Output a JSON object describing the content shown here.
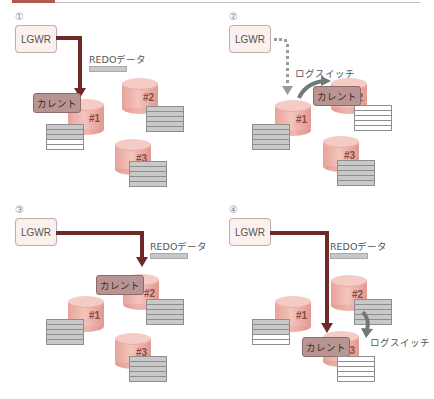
{
  "header": {
    "accent_color": "#b5584c",
    "line_color": "#bdbdbd"
  },
  "labels": {
    "lgwr": "LGWR",
    "redo_data": "REDOデータ",
    "current": "カレント",
    "log_switch": "ログスイッチ"
  },
  "colors": {
    "write_arrow": "#6e2a26",
    "dotted_arrow": "#9a9a9a",
    "switch_arrow": "#6f7a77",
    "cylinder": "#eeb3ab",
    "current_label_bg": "#b89592",
    "used_row": "#c9c9c9",
    "empty_row": "#ffffff"
  },
  "panels": [
    {
      "step": "①",
      "description": "LGWR writes REDO data to current log group #1",
      "lgwr_arrow": "solid",
      "current_group": "#1",
      "log_switch": false,
      "groups": [
        {
          "name": "#1",
          "rows": [
            "used",
            "used",
            "used",
            "empty",
            "empty"
          ]
        },
        {
          "name": "#2",
          "rows": [
            "used",
            "used",
            "used",
            "used",
            "used"
          ]
        },
        {
          "name": "#3",
          "rows": [
            "used",
            "used",
            "used",
            "used",
            "used"
          ]
        }
      ]
    },
    {
      "step": "②",
      "description": "Group #1 full; log switch moves current to #2",
      "lgwr_arrow": "dotted",
      "current_group": "#2",
      "log_switch": true,
      "groups": [
        {
          "name": "#1",
          "rows": [
            "used",
            "used",
            "used",
            "used",
            "used"
          ]
        },
        {
          "name": "#2",
          "rows": [
            "empty",
            "empty",
            "empty",
            "empty",
            "empty"
          ]
        },
        {
          "name": "#3",
          "rows": [
            "used",
            "used",
            "used",
            "used",
            "used"
          ]
        }
      ]
    },
    {
      "step": "③",
      "description": "LGWR writes REDO data to current log group #2",
      "lgwr_arrow": "solid",
      "current_group": "#2",
      "log_switch": false,
      "groups": [
        {
          "name": "#1",
          "rows": [
            "used",
            "used",
            "used",
            "used",
            "used"
          ]
        },
        {
          "name": "#2",
          "rows": [
            "used",
            "used",
            "used",
            "used",
            "used"
          ]
        },
        {
          "name": "#3",
          "rows": [
            "used",
            "used",
            "used",
            "used",
            "used"
          ]
        }
      ]
    },
    {
      "step": "④",
      "description": "Log switch to group #3; LGWR writes to #3",
      "lgwr_arrow": "solid",
      "current_group": "#3",
      "log_switch": true,
      "groups": [
        {
          "name": "#1",
          "rows": [
            "used",
            "used",
            "used",
            "empty",
            "empty"
          ]
        },
        {
          "name": "#2",
          "rows": [
            "used",
            "used",
            "used",
            "used",
            "used"
          ]
        },
        {
          "name": "#3",
          "rows": [
            "empty",
            "empty",
            "empty",
            "empty",
            "empty"
          ]
        }
      ]
    }
  ]
}
